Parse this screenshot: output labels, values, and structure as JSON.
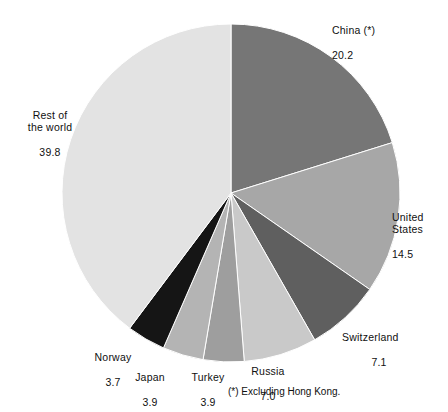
{
  "chart_data": {
    "type": "pie",
    "title": "",
    "subtitle": "",
    "xlabel": "",
    "ylabel": "",
    "legend_position": "none",
    "grid": false,
    "units": "percent",
    "total": 100.1,
    "start_angle_deg": 0,
    "direction": "clockwise",
    "categories": [
      "China (*)",
      "United States",
      "Switzerland",
      "Russia",
      "Turkey",
      "Japan",
      "Norway",
      "Rest of the world"
    ],
    "values": [
      20.2,
      14.5,
      7.1,
      7.0,
      3.9,
      3.9,
      3.7,
      39.8
    ],
    "colors": [
      "#767676",
      "#a7a7a7",
      "#5f5f5f",
      "#c9c9c9",
      "#9e9e9e",
      "#b4b4b4",
      "#151515",
      "#e3e3e3"
    ],
    "slices": [
      {
        "name": "China (*)",
        "value": 20.2,
        "color": "#767676",
        "label_name": "China (*)",
        "label_value": "20.2"
      },
      {
        "name": "United States",
        "value": 14.5,
        "color": "#a7a7a7",
        "label_name": "United\nStates",
        "label_value": "14.5"
      },
      {
        "name": "Switzerland",
        "value": 7.1,
        "color": "#5f5f5f",
        "label_name": "Switzerland",
        "label_value": "7.1"
      },
      {
        "name": "Russia",
        "value": 7.0,
        "color": "#c9c9c9",
        "label_name": "Russia",
        "label_value": "7.0"
      },
      {
        "name": "Turkey",
        "value": 3.9,
        "color": "#9e9e9e",
        "label_name": "Turkey",
        "label_value": "3.9"
      },
      {
        "name": "Japan",
        "value": 3.9,
        "color": "#b4b4b4",
        "label_name": "Japan",
        "label_value": "3.9"
      },
      {
        "name": "Norway",
        "value": 3.7,
        "color": "#151515",
        "label_name": "Norway",
        "label_value": "3.7"
      },
      {
        "name": "Rest of the world",
        "value": 39.8,
        "color": "#e3e3e3",
        "label_name": "Rest of\nthe world",
        "label_value": "39.8"
      }
    ],
    "annotations": [
      "(*) Excluding Hong Kong."
    ]
  },
  "labels": {
    "china": {
      "name": "China (*)",
      "value": "20.2"
    },
    "united": {
      "name": "United\nStates",
      "value": "14.5"
    },
    "switzerland": {
      "name": "Switzerland",
      "value": "7.1"
    },
    "russia": {
      "name": "Russia",
      "value": "7.0"
    },
    "turkey": {
      "name": "Turkey",
      "value": "3.9"
    },
    "japan": {
      "name": "Japan",
      "value": "3.9"
    },
    "norway": {
      "name": "Norway",
      "value": "3.7"
    },
    "rest": {
      "name": "Rest of\nthe world",
      "value": "39.8"
    }
  },
  "footnote": {
    "text": "(*) Excluding Hong Kong."
  }
}
